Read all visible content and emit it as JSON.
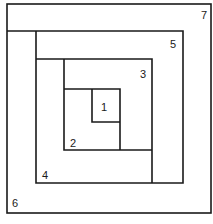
{
  "diagram": {
    "type": "nested-spiral-regions",
    "labels": [
      {
        "id": "1",
        "text": "1",
        "x": 105,
        "y": 112
      },
      {
        "id": "2",
        "text": "2",
        "x": 70,
        "y": 146
      },
      {
        "id": "3",
        "text": "3",
        "x": 140,
        "y": 78
      },
      {
        "id": "4",
        "text": "4",
        "x": 43,
        "y": 179
      },
      {
        "id": "5",
        "text": "5",
        "x": 171,
        "y": 49
      },
      {
        "id": "6",
        "text": "6",
        "x": 12,
        "y": 207
      },
      {
        "id": "7",
        "text": "7",
        "x": 200,
        "y": 20
      }
    ]
  }
}
